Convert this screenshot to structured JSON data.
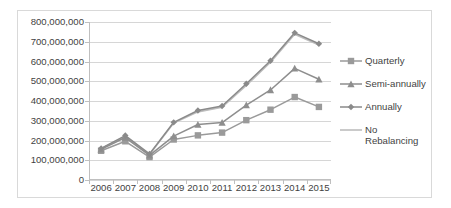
{
  "chart_data": {
    "type": "line",
    "title": "",
    "xlabel": "",
    "ylabel": "",
    "categories": [
      "2006",
      "2007",
      "2008",
      "2009",
      "2010",
      "2011",
      "2012",
      "2013",
      "2014",
      "2015"
    ],
    "ylim": [
      0,
      800000000
    ],
    "ytick_step": 100000000,
    "grid": true,
    "legend_position": "right",
    "ytick_labels": [
      "800,000,000",
      "700,000,000",
      "600,000,000",
      "500,000,000",
      "400,000,000",
      "300,000,000",
      "200,000,000",
      "100,000,000",
      "0"
    ],
    "ytick_values": [
      800000000,
      700000000,
      600000000,
      500000000,
      400000000,
      300000000,
      200000000,
      100000000,
      0
    ],
    "series": [
      {
        "name": "Quarterly",
        "marker": "square",
        "color": "#9a9a9a",
        "values": [
          148000000,
          196000000,
          116000000,
          205000000,
          226000000,
          240000000,
          303000000,
          356000000,
          420000000,
          370000000
        ]
      },
      {
        "name": "Semi-annually",
        "marker": "triangle",
        "color": "#8e8e8e",
        "values": [
          155000000,
          215000000,
          125000000,
          222000000,
          281000000,
          291000000,
          379000000,
          456000000,
          565000000,
          510000000
        ]
      },
      {
        "name": "Annually",
        "marker": "diamond",
        "color": "#8a8a8a",
        "values": [
          160000000,
          225000000,
          132000000,
          292000000,
          352000000,
          375000000,
          487000000,
          604000000,
          745000000,
          690000000
        ]
      },
      {
        "name": "No Rebalancing",
        "marker": "none",
        "color": "#bdbdbd",
        "values": [
          158000000,
          221000000,
          129000000,
          288000000,
          345000000,
          369000000,
          479000000,
          596000000,
          738000000,
          684000000
        ]
      }
    ]
  },
  "legend": {
    "items": [
      {
        "label": "Quarterly"
      },
      {
        "label": "Semi-annually"
      },
      {
        "label": "Annually"
      },
      {
        "label": "No Rebalancing"
      }
    ]
  },
  "colors": {
    "gridline": "#d6d6d6",
    "axis": "#bfbfbf",
    "text": "#3f3f3f",
    "border": "#d9d9d9",
    "background": "#ffffff"
  }
}
